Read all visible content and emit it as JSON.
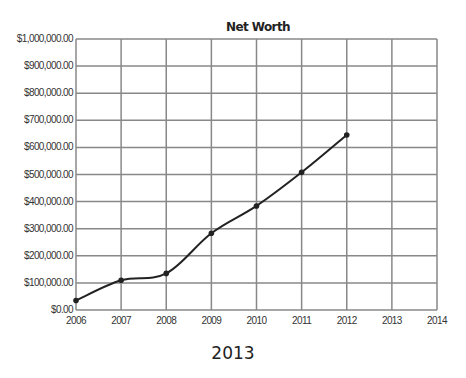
{
  "chart_data": {
    "type": "line",
    "title": "Net Worth",
    "xlabel": "",
    "ylabel": "",
    "x_ticks": [
      "2006",
      "2007",
      "2008",
      "2009",
      "2010",
      "2011",
      "2012",
      "2013",
      "2014"
    ],
    "y_ticks": [
      "$0.00",
      "$100,000.00",
      "$200,000.00",
      "$300,000.00",
      "$400,000.00",
      "$500,000.00",
      "$600,000.00",
      "$700,000.00",
      "$800,000.00",
      "$900,000.00",
      "$1,000,000.00"
    ],
    "xlim": [
      2006,
      2014
    ],
    "ylim": [
      0,
      1000000
    ],
    "grid": true,
    "legend": null,
    "series": [
      {
        "name": "Net Worth",
        "x": [
          2006,
          2007,
          2008,
          2009,
          2010,
          2011,
          2012
        ],
        "values": [
          35000,
          110000,
          135000,
          283000,
          384000,
          508000,
          646000
        ]
      }
    ]
  },
  "caption": "2013",
  "colors": {
    "grid": "#888888",
    "line": "#222222",
    "text": "#222222"
  }
}
